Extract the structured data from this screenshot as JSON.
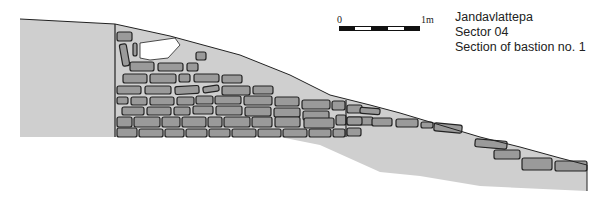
{
  "title": {
    "site": "Jandavlattepa",
    "sector": "Sector 04",
    "section": "Section of bastion no. 1"
  },
  "scale_bar": {
    "start_label": "0",
    "end_label": "1m",
    "segments": [
      "dark",
      "light",
      "dark",
      "light",
      "dark"
    ]
  },
  "colors": {
    "fill_soil": "#cfcfcf",
    "stone": "#9a9a9a",
    "outline": "#222222",
    "void": "#ffffff"
  },
  "shapes": {
    "left_block": "20,19 115,24 115,137 20,137",
    "soil_body": "115,24 170,36 240,55 290,75 330,95 370,105 400,113 440,125 480,137 520,147 560,158 587,165 587,191 480,186 420,176 380,172 320,145 280,137 115,137",
    "void": "140,43 175,38 180,45 168,58 150,60 140,58"
  },
  "stones": [
    {
      "x": 117,
      "y": 32,
      "w": 15,
      "h": 9,
      "r": 0
    },
    {
      "x": 121,
      "y": 44,
      "w": 7,
      "h": 22,
      "r": -10
    },
    {
      "x": 133,
      "y": 43,
      "w": 4,
      "h": 13,
      "r": 0
    },
    {
      "x": 196,
      "y": 52,
      "w": 10,
      "h": 8,
      "r": 0
    },
    {
      "x": 130,
      "y": 62,
      "w": 24,
      "h": 9,
      "r": 0
    },
    {
      "x": 158,
      "y": 63,
      "w": 25,
      "h": 8,
      "r": 0
    },
    {
      "x": 187,
      "y": 63,
      "w": 11,
      "h": 8,
      "r": 0
    },
    {
      "x": 123,
      "y": 74,
      "w": 24,
      "h": 9,
      "r": 0
    },
    {
      "x": 150,
      "y": 74,
      "w": 26,
      "h": 9,
      "r": 0
    },
    {
      "x": 179,
      "y": 74,
      "w": 11,
      "h": 8,
      "r": 0
    },
    {
      "x": 194,
      "y": 74,
      "w": 25,
      "h": 8,
      "r": 0
    },
    {
      "x": 222,
      "y": 75,
      "w": 20,
      "h": 8,
      "r": 0
    },
    {
      "x": 117,
      "y": 86,
      "w": 24,
      "h": 8,
      "r": 0
    },
    {
      "x": 145,
      "y": 86,
      "w": 26,
      "h": 8,
      "r": 0
    },
    {
      "x": 175,
      "y": 86,
      "w": 24,
      "h": 8,
      "r": -3
    },
    {
      "x": 203,
      "y": 86,
      "w": 16,
      "h": 6,
      "r": -8
    },
    {
      "x": 222,
      "y": 86,
      "w": 28,
      "h": 9,
      "r": 0
    },
    {
      "x": 253,
      "y": 86,
      "w": 20,
      "h": 8,
      "r": 0
    },
    {
      "x": 117,
      "y": 97,
      "w": 11,
      "h": 7,
      "r": 0
    },
    {
      "x": 131,
      "y": 97,
      "w": 16,
      "h": 8,
      "r": 0
    },
    {
      "x": 150,
      "y": 97,
      "w": 24,
      "h": 8,
      "r": 0
    },
    {
      "x": 177,
      "y": 97,
      "w": 17,
      "h": 8,
      "r": 0
    },
    {
      "x": 196,
      "y": 96,
      "w": 17,
      "h": 8,
      "r": 0
    },
    {
      "x": 215,
      "y": 96,
      "w": 26,
      "h": 8,
      "r": 0
    },
    {
      "x": 244,
      "y": 96,
      "w": 28,
      "h": 9,
      "r": 0
    },
    {
      "x": 275,
      "y": 97,
      "w": 24,
      "h": 9,
      "r": 0
    },
    {
      "x": 302,
      "y": 100,
      "w": 28,
      "h": 9,
      "r": 0
    },
    {
      "x": 332,
      "y": 101,
      "w": 13,
      "h": 9,
      "r": 0
    },
    {
      "x": 122,
      "y": 107,
      "w": 22,
      "h": 8,
      "r": 0
    },
    {
      "x": 147,
      "y": 107,
      "w": 24,
      "h": 8,
      "r": 0
    },
    {
      "x": 174,
      "y": 107,
      "w": 16,
      "h": 8,
      "r": 0
    },
    {
      "x": 193,
      "y": 106,
      "w": 20,
      "h": 8,
      "r": 0
    },
    {
      "x": 216,
      "y": 106,
      "w": 26,
      "h": 9,
      "r": 0
    },
    {
      "x": 245,
      "y": 107,
      "w": 26,
      "h": 9,
      "r": 0
    },
    {
      "x": 274,
      "y": 108,
      "w": 26,
      "h": 9,
      "r": 0
    },
    {
      "x": 303,
      "y": 111,
      "w": 26,
      "h": 9,
      "r": 0
    },
    {
      "x": 117,
      "y": 117,
      "w": 15,
      "h": 10,
      "r": 0
    },
    {
      "x": 134,
      "y": 117,
      "w": 26,
      "h": 10,
      "r": 0
    },
    {
      "x": 162,
      "y": 117,
      "w": 18,
      "h": 10,
      "r": 0
    },
    {
      "x": 182,
      "y": 117,
      "w": 24,
      "h": 10,
      "r": 0
    },
    {
      "x": 208,
      "y": 117,
      "w": 14,
      "h": 10,
      "r": 0
    },
    {
      "x": 224,
      "y": 117,
      "w": 26,
      "h": 10,
      "r": 0
    },
    {
      "x": 252,
      "y": 117,
      "w": 20,
      "h": 10,
      "r": 0
    },
    {
      "x": 275,
      "y": 117,
      "w": 25,
      "h": 10,
      "r": 0
    },
    {
      "x": 304,
      "y": 118,
      "w": 30,
      "h": 10,
      "r": 0
    },
    {
      "x": 336,
      "y": 115,
      "w": 10,
      "h": 10,
      "r": 0
    },
    {
      "x": 347,
      "y": 117,
      "w": 26,
      "h": 8,
      "r": 0
    },
    {
      "x": 117,
      "y": 128,
      "w": 20,
      "h": 9,
      "r": 0
    },
    {
      "x": 139,
      "y": 129,
      "w": 24,
      "h": 8,
      "r": 0
    },
    {
      "x": 165,
      "y": 129,
      "w": 19,
      "h": 8,
      "r": 0
    },
    {
      "x": 186,
      "y": 129,
      "w": 21,
      "h": 8,
      "r": 0
    },
    {
      "x": 209,
      "y": 129,
      "w": 21,
      "h": 8,
      "r": 0
    },
    {
      "x": 232,
      "y": 129,
      "w": 24,
      "h": 8,
      "r": 0
    },
    {
      "x": 258,
      "y": 129,
      "w": 23,
      "h": 8,
      "r": 0
    },
    {
      "x": 283,
      "y": 129,
      "w": 24,
      "h": 8,
      "r": 0
    },
    {
      "x": 309,
      "y": 129,
      "w": 22,
      "h": 8,
      "r": 0
    },
    {
      "x": 333,
      "y": 129,
      "w": 12,
      "h": 8,
      "r": 0
    },
    {
      "x": 347,
      "y": 128,
      "w": 14,
      "h": 8,
      "r": 0
    },
    {
      "x": 347,
      "y": 105,
      "w": 15,
      "h": 8,
      "r": 0
    },
    {
      "x": 360,
      "y": 108,
      "w": 20,
      "h": 6,
      "r": 5
    },
    {
      "x": 347,
      "y": 117,
      "w": 15,
      "h": 8,
      "r": 0
    },
    {
      "x": 372,
      "y": 118,
      "w": 20,
      "h": 8,
      "r": 0
    },
    {
      "x": 396,
      "y": 119,
      "w": 22,
      "h": 8,
      "r": 0
    },
    {
      "x": 421,
      "y": 122,
      "w": 12,
      "h": 6,
      "r": 0
    },
    {
      "x": 434,
      "y": 124,
      "w": 28,
      "h": 8,
      "r": 5
    },
    {
      "x": 475,
      "y": 140,
      "w": 32,
      "h": 8,
      "r": 5
    },
    {
      "x": 494,
      "y": 150,
      "w": 26,
      "h": 9,
      "r": 0
    },
    {
      "x": 522,
      "y": 158,
      "w": 30,
      "h": 12,
      "r": 0
    },
    {
      "x": 555,
      "y": 161,
      "w": 32,
      "h": 10,
      "r": 0
    }
  ],
  "wall_lines": [
    {
      "x1": 115,
      "y1": 24,
      "x2": 115,
      "y2": 137
    },
    {
      "x1": 346,
      "y1": 100,
      "x2": 346,
      "y2": 137
    }
  ],
  "surface_line": "20,19 115,24 170,36 240,55 290,75 330,95 370,105 400,113 440,125 480,137 520,147 560,158 587,165 587,191"
}
